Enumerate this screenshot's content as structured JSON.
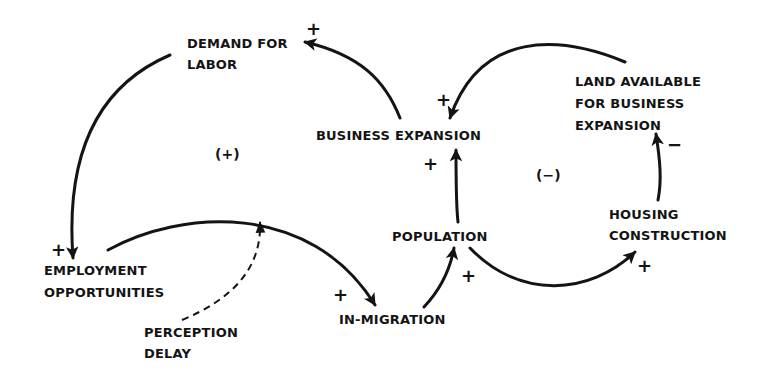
{
  "diagram": {
    "type": "causal-loop",
    "nodes": {
      "demand_for_labor": [
        "DEMAND FOR",
        "LABOR"
      ],
      "employment_opportunities": [
        "EMPLOYMENT",
        "OPPORTUNITIES"
      ],
      "perception_delay": [
        "PERCEPTION",
        "DELAY"
      ],
      "in_migration": [
        "IN-MIGRATION"
      ],
      "population": [
        "POPULATION"
      ],
      "business_expansion": [
        "BUSINESS EXPANSION"
      ],
      "land_available": [
        "LAND AVAILABLE",
        "FOR BUSINESS",
        "EXPANSION"
      ],
      "housing_construction": [
        "HOUSING",
        "CONSTRUCTION"
      ]
    },
    "loops": {
      "left": "(+)",
      "right": "(−)"
    },
    "polarities": {
      "be_to_demand": "+",
      "demand_to_employment": "+",
      "employment_to_inmigration": "+",
      "inmigration_to_population": "+",
      "population_to_be": "+",
      "population_to_housing": "+",
      "housing_to_land": "−",
      "land_to_be": "+"
    },
    "edges": [
      {
        "from": "BUSINESS EXPANSION",
        "to": "DEMAND FOR LABOR",
        "polarity": "+"
      },
      {
        "from": "DEMAND FOR LABOR",
        "to": "EMPLOYMENT OPPORTUNITIES",
        "polarity": "+"
      },
      {
        "from": "EMPLOYMENT OPPORTUNITIES",
        "to": "IN-MIGRATION",
        "polarity": "+",
        "delay": "PERCEPTION DELAY"
      },
      {
        "from": "IN-MIGRATION",
        "to": "POPULATION",
        "polarity": "+"
      },
      {
        "from": "POPULATION",
        "to": "BUSINESS EXPANSION",
        "polarity": "+"
      },
      {
        "from": "POPULATION",
        "to": "HOUSING CONSTRUCTION",
        "polarity": "+"
      },
      {
        "from": "HOUSING CONSTRUCTION",
        "to": "LAND AVAILABLE FOR BUSINESS EXPANSION",
        "polarity": "−"
      },
      {
        "from": "LAND AVAILABLE FOR BUSINESS EXPANSION",
        "to": "BUSINESS EXPANSION",
        "polarity": "+"
      }
    ],
    "colors": {
      "ink": "#141414",
      "background": "#ffffff"
    }
  }
}
